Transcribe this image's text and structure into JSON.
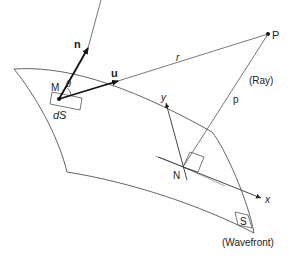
{
  "diagram": {
    "colors": {
      "line": "#555555",
      "vector": "#111111",
      "text": "#222222",
      "background": "#ffffff"
    },
    "labels": {
      "normal_vector": "n",
      "unit_vector": "u",
      "angle": "θ",
      "point_M": "M",
      "surface_element": "dS",
      "distance_r": "r",
      "point_P": "P",
      "ray_label": "(Ray)",
      "distance_p": "p",
      "axis_y": "y",
      "axis_x": "x",
      "point_N": "N",
      "surface_S": "S",
      "wavefront_label": "(Wavefront)"
    }
  }
}
